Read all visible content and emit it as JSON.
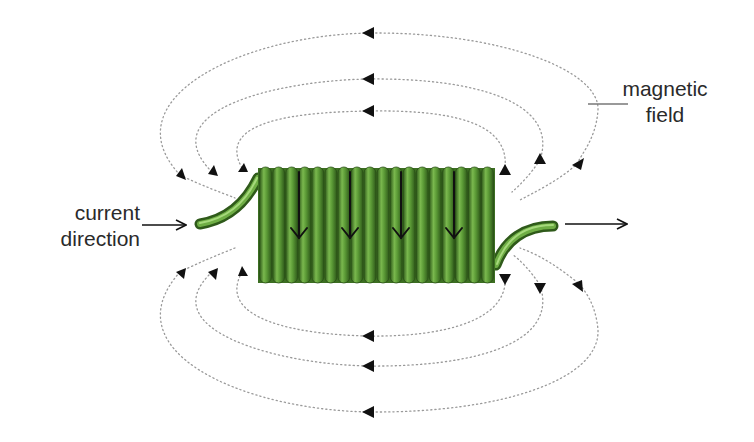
{
  "diagram": {
    "labels": {
      "current_direction": [
        "current",
        "direction"
      ],
      "magnetic_field": [
        "magnetic",
        "field"
      ]
    },
    "colors": {
      "coil": "#4e8a2e",
      "coil_light": "#7ab84e",
      "coil_dark": "#2f5a1a",
      "field_line": "#9a9a9a",
      "arrow": "#111111",
      "text": "#2a2a2a"
    },
    "coil": {
      "loop_count": 18,
      "internal_current_arrows": 4,
      "internal_arrow_direction": "down"
    },
    "field_lines": {
      "top_loops": 3,
      "bottom_loops": 3,
      "arrow_direction_outside": "left"
    },
    "current_arrows": {
      "incoming": "right",
      "outgoing": "right"
    }
  }
}
